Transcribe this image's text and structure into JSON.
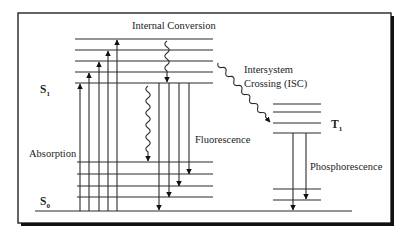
{
  "diagram": {
    "type": "jablonski",
    "colors": {
      "line": "#2b2b2b",
      "frame": "#111111",
      "text": "#222222",
      "background": "#ffffff"
    },
    "frame": {
      "x": 18,
      "y": 13,
      "w": 373,
      "h": 210,
      "shadow": 3
    },
    "states": {
      "S1": {
        "label": "S",
        "sub": "1",
        "label_x": 40,
        "label_y": 93,
        "x1": 75,
        "x2": 213,
        "levels": [
          39,
          50,
          61,
          72,
          83
        ]
      },
      "S0": {
        "label": "S",
        "sub": "0",
        "label_x": 40,
        "label_y": 205,
        "x1": 77,
        "x2": 213,
        "levels": [
          162,
          174,
          186,
          197
        ]
      },
      "T1": {
        "label": "T",
        "sub": "1",
        "label_x": 331,
        "label_y": 128,
        "x1": 273,
        "x2": 321,
        "levels": [
          104,
          112,
          123,
          133,
          189,
          200
        ]
      },
      "ground": {
        "x1": 35,
        "x2": 352,
        "y": 211
      }
    },
    "processes": {
      "absorption": {
        "label": "Absorption",
        "label_x": 29,
        "label_y": 157,
        "arrows": [
          {
            "x": 80,
            "y1": 211,
            "y2": 84
          },
          {
            "x": 89,
            "y1": 211,
            "y2": 73
          },
          {
            "x": 99,
            "y1": 211,
            "y2": 62
          },
          {
            "x": 108,
            "y1": 211,
            "y2": 51
          },
          {
            "x": 117,
            "y1": 211,
            "y2": 40
          }
        ]
      },
      "internal_conversion": {
        "label": "Internal Conversion",
        "label_x": 132,
        "label_y": 29,
        "waves": [
          {
            "x1": 167,
            "y1": 41,
            "x2": 167,
            "y2": 82
          },
          {
            "x1": 148,
            "y1": 86,
            "x2": 148,
            "y2": 161
          }
        ]
      },
      "fluorescence": {
        "label": "Fluorescence",
        "label_x": 195,
        "label_y": 143,
        "arrows": [
          {
            "x": 159,
            "y1": 83,
            "y2": 210
          },
          {
            "x": 169,
            "y1": 83,
            "y2": 197
          },
          {
            "x": 179,
            "y1": 83,
            "y2": 186
          },
          {
            "x": 189,
            "y1": 83,
            "y2": 174
          }
        ]
      },
      "intersystem_crossing": {
        "label_line1": "Intersystem",
        "label_line2": "Crossing (ISC)",
        "label_x": 244,
        "label_y1": 73,
        "label_y2": 87,
        "wave": {
          "x1": 218,
          "y1": 63,
          "x2": 270,
          "y2": 122
        }
      },
      "phosphorescence": {
        "label": "Phosphorescence",
        "label_x": 310,
        "label_y": 170,
        "arrows": [
          {
            "x": 293,
            "y1": 133,
            "y2": 210
          },
          {
            "x": 306,
            "y1": 133,
            "y2": 199
          }
        ]
      }
    }
  }
}
